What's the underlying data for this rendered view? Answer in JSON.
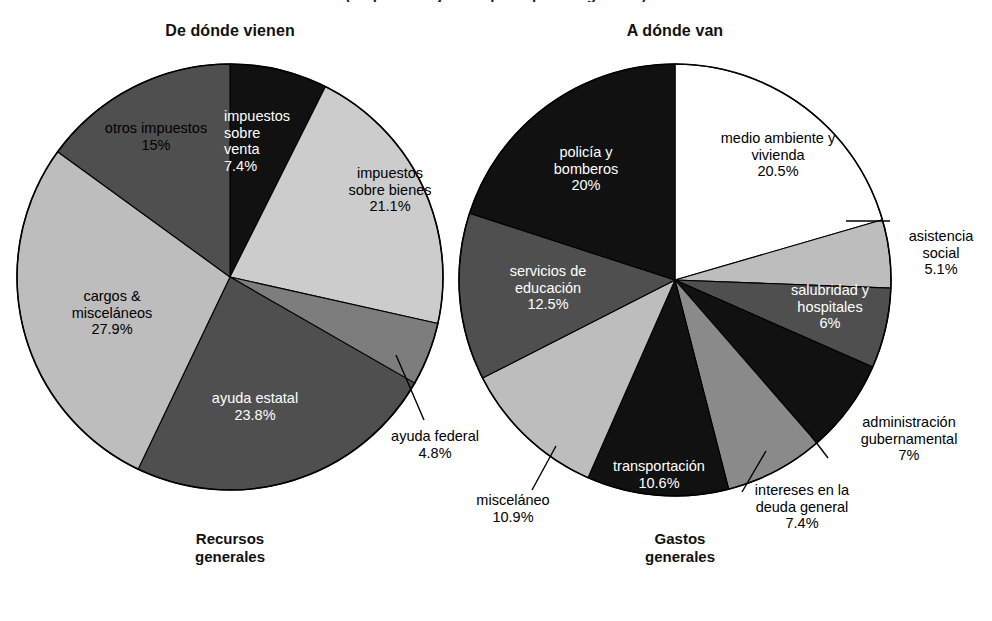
{
  "figure": {
    "cut_top_line": "(en porcentajes del presupuesto general)",
    "background": "#ffffff"
  },
  "palette": {
    "black": "#111111",
    "dark_gray": "#4f4f4f",
    "mid_gray": "#7d7d7d",
    "light_gray": "#bdbdbd",
    "white": "#ffffff",
    "outline": "#000000"
  },
  "left_panel": {
    "title": "De dónde vienen",
    "caption_line1": "Recursos",
    "caption_line2": "generales"
  },
  "right_panel": {
    "title": "A dónde van",
    "caption_line1": "Gastos",
    "caption_line2": "generales"
  },
  "chart_data": [
    {
      "type": "pie",
      "title": "De dónde vienen",
      "subtitle": "Recursos generales",
      "start_angle_deg": 0,
      "direction": "clockwise",
      "categories": [
        "impuestos sobre venta",
        "impuestos sobre bienes",
        "ayuda federal",
        "ayuda estatal",
        "cargos & misceláneos",
        "otros impuestos"
      ],
      "values": [
        7.4,
        21.1,
        4.8,
        23.8,
        27.9,
        15.0
      ],
      "value_labels": [
        "7.4%",
        "21.1%",
        "4.8%",
        "23.8%",
        "27.9%",
        "15%"
      ],
      "slices": [
        {
          "label_line1": "impuestos",
          "label_line2": "sobre",
          "label_line3": "venta",
          "value": "7.4%",
          "fill": "#111111",
          "text": "light",
          "leader": false
        },
        {
          "label_line1": "impuestos",
          "label_line2": "sobre bienes",
          "label_line3": "",
          "value": "21.1%",
          "fill": "#cccccc",
          "text": "dark",
          "leader": false
        },
        {
          "label_line1": "ayuda federal",
          "label_line2": "",
          "label_line3": "",
          "value": "4.8%",
          "fill": "#7d7d7d",
          "text": "dark",
          "leader": true
        },
        {
          "label_line1": "ayuda estatal",
          "label_line2": "",
          "label_line3": "",
          "value": "23.8%",
          "fill": "#4f4f4f",
          "text": "light",
          "leader": false
        },
        {
          "label_line1": "cargos &",
          "label_line2": "misceláneos",
          "label_line3": "",
          "value": "27.9%",
          "fill": "#bdbdbd",
          "text": "dark",
          "leader": false
        },
        {
          "label_line1": "otros impuestos",
          "label_line2": "",
          "label_line3": "",
          "value": "15%",
          "fill": "#4f4f4f",
          "text": "dark",
          "leader": false
        }
      ]
    },
    {
      "type": "pie",
      "title": "A dónde van",
      "subtitle": "Gastos generales",
      "start_angle_deg": 0,
      "direction": "clockwise",
      "categories": [
        "medio ambiente y vivienda",
        "asistencia social",
        "salubridad y hospitales",
        "administración gubernamental",
        "intereses en la deuda general",
        "transportación",
        "misceláneo",
        "servicios de educación",
        "policía y bomberos"
      ],
      "values": [
        20.5,
        5.1,
        6.0,
        7.0,
        7.4,
        10.6,
        10.9,
        12.5,
        20.0
      ],
      "value_labels": [
        "20.5%",
        "5.1%",
        "6%",
        "7%",
        "7.4%",
        "10.6%",
        "10.9%",
        "12.5%",
        "20%"
      ],
      "slices": [
        {
          "label_line1": "medio ambiente y",
          "label_line2": "vivienda",
          "label_line3": "",
          "value": "20.5%",
          "fill": "#ffffff",
          "text": "dark",
          "leader": false
        },
        {
          "label_line1": "asistencia",
          "label_line2": "social",
          "label_line3": "",
          "value": "5.1%",
          "fill": "#bdbdbd",
          "text": "dark",
          "leader": true
        },
        {
          "label_line1": "salubridad y",
          "label_line2": "hospitales",
          "label_line3": "",
          "value": "6%",
          "fill": "#4f4f4f",
          "text": "light",
          "leader": false
        },
        {
          "label_line1": "administración",
          "label_line2": "gubernamental",
          "label_line3": "",
          "value": "7%",
          "fill": "#111111",
          "text": "dark",
          "leader": true
        },
        {
          "label_line1": "intereses en la",
          "label_line2": "deuda general",
          "label_line3": "",
          "value": "7.4%",
          "fill": "#8a8a8a",
          "text": "dark",
          "leader": true
        },
        {
          "label_line1": "transportación",
          "label_line2": "",
          "label_line3": "",
          "value": "10.6%",
          "fill": "#111111",
          "text": "light",
          "leader": false
        },
        {
          "label_line1": "misceláneo",
          "label_line2": "",
          "label_line3": "",
          "value": "10.9%",
          "fill": "#bdbdbd",
          "text": "dark",
          "leader": true
        },
        {
          "label_line1": "servicios de",
          "label_line2": "educación",
          "label_line3": "",
          "value": "12.5%",
          "fill": "#4f4f4f",
          "text": "light",
          "leader": false
        },
        {
          "label_line1": "policía y",
          "label_line2": "bomberos",
          "label_line3": "",
          "value": "20%",
          "fill": "#111111",
          "text": "light",
          "leader": false
        }
      ]
    }
  ]
}
